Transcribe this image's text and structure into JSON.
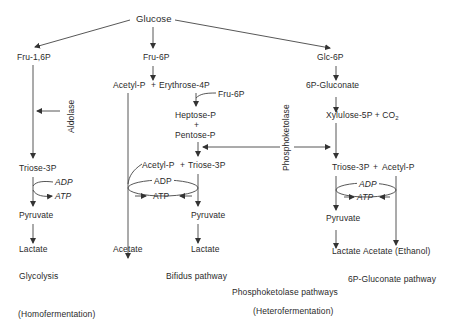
{
  "diagram": {
    "root": "Glucose",
    "glycolysis": {
      "nodes": [
        "Fru-1,6P",
        "Triose-3P",
        "Pyruvate",
        "Lactate"
      ],
      "enzyme": "Aldolase",
      "cofactor_in": "ADP",
      "cofactor_out": "ATP",
      "pathway_name": "Glycolysis",
      "fermentation_type": "(Homofermentation)"
    },
    "bifidus": {
      "fru6p": "Fru-6P",
      "acetyl_p": "Acetyl-P",
      "plus": "+",
      "erythrose": "Erythrose-4P",
      "fru6p_side": "Fru-6P",
      "heptose": "Heptose-P",
      "pentose": "Pentose-P",
      "acetyl_p2": "Acetyl-P",
      "triose": "Triose-3P",
      "adp": "ADP",
      "atp": "ATP",
      "pyruvate": "Pyruvate",
      "acetate": "Acetate",
      "lactate": "Lactate",
      "pathway_name": "Bifidus pathway"
    },
    "phosphoketolase": {
      "enzyme": "Phosphoketolase",
      "pathways_name": "Phosphoketolase pathways",
      "fermentation_type": "(Heterofermentation)"
    },
    "gluconate": {
      "glc6p": "Glc-6P",
      "gluconate": "6P-Gluconate",
      "xylulose": "Xylulose-5P",
      "plus_co2": "+ CO",
      "co2_sub": "2",
      "triose": "Triose-3P",
      "plus": "+",
      "acetyl_p": "Acetyl-P",
      "adp": "ADP",
      "atp": "ATP",
      "pyruvate": "Pyruvate",
      "lactate": "Lactate",
      "acetate_ethanol": "Acetate (Ethanol)",
      "pathway_name": "6P-Gluconate pathway"
    }
  },
  "colors": {
    "line": "#333333",
    "text": "#2a2a2a",
    "background": "#ffffff"
  }
}
